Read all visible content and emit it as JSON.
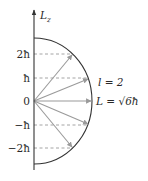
{
  "diagram": {
    "axis_label": "L",
    "axis_label_sub": "z",
    "tick_labels": [
      "2ħ",
      "ħ",
      "0",
      "−ħ",
      "−2ħ"
    ],
    "quantum_number_label": "l = 2",
    "magnitude_label": "L = √6ħ",
    "colors": {
      "axis": "#333333",
      "arc": "#333333",
      "vectors": "#9a9a9a",
      "dashed": "#9a9a9a",
      "text": "#2a2a2a"
    },
    "m_values": [
      2,
      1,
      0,
      -1,
      -2
    ]
  }
}
